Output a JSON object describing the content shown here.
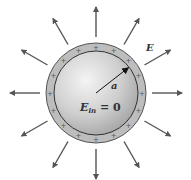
{
  "figure": {
    "labels": {
      "field": "E",
      "radius": "a",
      "inside_main": "E",
      "inside_sub": "in",
      "inside_rest": " = 0"
    },
    "charge_symbol": "+",
    "colors": {
      "arrow": "#555555",
      "shell": "#b8b8b8",
      "sphere_light": "#f2f2f2",
      "sphere_dark": "#a8a8a8",
      "outline": "#333333"
    },
    "geometry": {
      "center": [
        96,
        93
      ],
      "outer_radius": 50,
      "inner_radius": 42,
      "arrow_start": 56,
      "arrow_end": 86,
      "arrow_count": 12,
      "plus_count": 16
    }
  }
}
